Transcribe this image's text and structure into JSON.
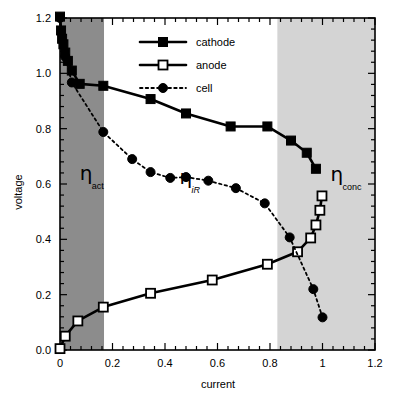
{
  "chart_data": {
    "type": "line",
    "title": "",
    "xlabel": "current",
    "ylabel": "voltage",
    "xlim": [
      0,
      1.2
    ],
    "ylim": [
      0,
      1.2
    ],
    "xticks": [
      0,
      0.2,
      0.4,
      0.6,
      0.8,
      1,
      1.2
    ],
    "xtick_labels": [
      "0",
      "0.2",
      "0.4",
      "0.6",
      "0.8",
      "1",
      "1.2"
    ],
    "yticks": [
      0.0,
      0.2,
      0.4,
      0.6,
      0.8,
      1.0,
      1.2
    ],
    "ytick_labels": [
      "0.0",
      "0.2",
      "0.4",
      "0.6",
      "0.8",
      "1.0",
      "1.2"
    ],
    "x_minor_ticks_per_interval": 4,
    "y_minor_ticks_per_interval": 4,
    "grid": false,
    "legend_position": "top-center",
    "series": [
      {
        "name": "cathode",
        "marker": "filled-square",
        "linestyle": "solid",
        "color": "#000000",
        "x": [
          0.0,
          0.004,
          0.008,
          0.013,
          0.02,
          0.03,
          0.045,
          0.075,
          0.165,
          0.345,
          0.48,
          0.65,
          0.79,
          0.88,
          0.94,
          0.975
        ],
        "y": [
          1.205,
          1.155,
          1.125,
          1.105,
          1.075,
          1.045,
          1.01,
          0.962,
          0.955,
          0.907,
          0.855,
          0.808,
          0.808,
          0.757,
          0.713,
          0.655
        ]
      },
      {
        "name": "anode",
        "marker": "open-square",
        "linestyle": "solid",
        "color": "#000000",
        "x": [
          0.0,
          0.02,
          0.068,
          0.165,
          0.345,
          0.58,
          0.79,
          0.905,
          0.955,
          0.975,
          0.99,
          0.998
        ],
        "y": [
          0.005,
          0.05,
          0.105,
          0.155,
          0.205,
          0.253,
          0.31,
          0.355,
          0.405,
          0.452,
          0.505,
          0.557
        ]
      },
      {
        "name": "cell",
        "marker": "filled-circle",
        "linestyle": "dotted",
        "color": "#000000",
        "x": [
          0.0,
          0.02,
          0.045,
          0.165,
          0.275,
          0.345,
          0.42,
          0.48,
          0.565,
          0.67,
          0.78,
          0.875,
          0.965,
          1.0
        ],
        "y": [
          1.2,
          1.06,
          0.967,
          0.788,
          0.69,
          0.643,
          0.622,
          0.625,
          0.612,
          0.585,
          0.53,
          0.407,
          0.22,
          0.118
        ]
      }
    ],
    "shaded_regions": [
      {
        "label": "eta_act",
        "x_start": 0.0,
        "x_end": 0.168,
        "color": "#8c8c8c"
      },
      {
        "label": "eta_ohm",
        "x_start": 0.168,
        "x_end": 0.828,
        "color": "#ffffff"
      },
      {
        "label": "eta_conc",
        "x_start": 0.828,
        "x_end": 1.2,
        "color": "#d4d4d4"
      }
    ],
    "annotations": [
      {
        "name": "eta-act",
        "symbol": "η",
        "subscript": "act",
        "subscript_italic": false,
        "x": 0.075,
        "y": 0.615
      },
      {
        "name": "eta-iR",
        "symbol": "η",
        "subscript": "iR",
        "subscript_italic": true,
        "x": 0.455,
        "y": 0.6
      },
      {
        "name": "eta-conc",
        "symbol": "η",
        "subscript": "conc",
        "subscript_italic": false,
        "x": 1.03,
        "y": 0.61
      }
    ],
    "legend": [
      {
        "label": "cathode",
        "marker": "filled-square",
        "linestyle": "solid"
      },
      {
        "label": "anode",
        "marker": "open-square",
        "linestyle": "solid"
      },
      {
        "label": "cell",
        "marker": "filled-circle",
        "linestyle": "dotted"
      }
    ],
    "colors": {
      "axis": "#000000",
      "series": "#000000",
      "band_dark": "#8c8c8c",
      "band_light": "#d4d4d4",
      "background": "#ffffff"
    }
  }
}
